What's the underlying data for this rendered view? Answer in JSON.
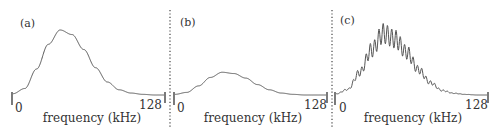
{
  "chart_data": [
    {
      "type": "line",
      "panel": "(a)",
      "title": "(a)",
      "xlabel": "frequency (kHz)",
      "ylabel": "",
      "x_ticks": [
        "0",
        "128"
      ],
      "xlim": [
        0,
        128
      ],
      "grid": false,
      "description": "single smooth Gaussian-like spectrum, peak near 40 kHz, high amplitude",
      "x": [
        0,
        10,
        20,
        30,
        40,
        50,
        60,
        70,
        80,
        90,
        100,
        110,
        120,
        128
      ],
      "values": [
        0.02,
        0.1,
        0.4,
        0.78,
        1.0,
        0.93,
        0.7,
        0.42,
        0.2,
        0.08,
        0.03,
        0.01,
        0.0,
        0.0
      ]
    },
    {
      "type": "line",
      "panel": "(b)",
      "title": "(b)",
      "xlabel": "frequency (kHz)",
      "ylabel": "",
      "x_ticks": [
        "0",
        "128"
      ],
      "xlim": [
        0,
        128
      ],
      "grid": false,
      "description": "same spectral shape with much lower amplitude",
      "x": [
        0,
        10,
        20,
        30,
        40,
        50,
        60,
        70,
        80,
        90,
        100,
        110,
        120,
        128
      ],
      "values": [
        0.01,
        0.04,
        0.14,
        0.27,
        0.35,
        0.33,
        0.26,
        0.16,
        0.08,
        0.03,
        0.01,
        0.0,
        0.0,
        0.0
      ]
    },
    {
      "type": "line",
      "panel": "(c)",
      "title": "(c)",
      "xlabel": "frequency (kHz)",
      "ylabel": "",
      "x_ticks": [
        "0",
        "128"
      ],
      "xlim": [
        0,
        128
      ],
      "grid": false,
      "description": "Gaussian-like envelope with strong periodic ripple (comb modulation), peak amplitude slightly above panel (a)",
      "envelope_x": [
        0,
        10,
        20,
        30,
        40,
        50,
        60,
        70,
        80,
        90,
        100,
        110,
        120,
        128
      ],
      "envelope_values": [
        0.02,
        0.1,
        0.4,
        0.8,
        1.1,
        1.0,
        0.76,
        0.45,
        0.22,
        0.08,
        0.03,
        0.01,
        0.0,
        0.0
      ],
      "ripple_count": 16
    }
  ],
  "panels": [
    {
      "label": "(a)",
      "tick_start": "0",
      "tick_end": "128",
      "xlabel": "frequency (kHz)"
    },
    {
      "label": "(b)",
      "tick_start": "0",
      "tick_end": "128",
      "xlabel": "frequency (kHz)"
    },
    {
      "label": "(c)",
      "tick_start": "0",
      "tick_end": "128",
      "xlabel": "frequency (kHz)"
    }
  ],
  "colors": {
    "curve": "#555555",
    "divider": "#444444",
    "text": "#333333"
  }
}
